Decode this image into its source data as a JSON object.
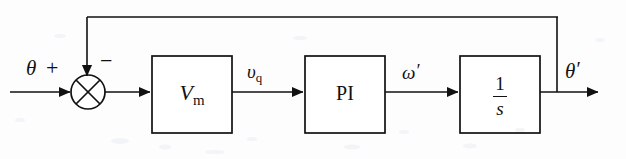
{
  "diagram": {
    "type": "control-system-block-diagram",
    "background_color": "#fdfdfe",
    "line_color": "#111111",
    "input": {
      "label": "θ",
      "name": "theta-reference-input"
    },
    "output": {
      "label": "θ",
      "prime": "′",
      "name": "theta-prime-output"
    },
    "summing_junction": {
      "name": "summing-junction",
      "style": "circle-with-cross",
      "plus_sign": "+",
      "minus_sign": "−"
    },
    "blocks": [
      {
        "id": "vm",
        "label": "V",
        "subscript": "m",
        "name": "vm-block",
        "x": 152,
        "y": 56,
        "w": 80,
        "h": 77
      },
      {
        "id": "pi",
        "label": "PI",
        "subscript": "",
        "name": "pi-controller-block",
        "x": 305,
        "y": 56,
        "w": 80,
        "h": 77
      },
      {
        "id": "integrator",
        "label": "1",
        "denominator": "s",
        "name": "integrator-block",
        "x": 460,
        "y": 56,
        "w": 80,
        "h": 77
      }
    ],
    "signals": [
      {
        "id": "vq",
        "label": "υ",
        "subscript": "q",
        "prime": "",
        "name": "vq-signal-label"
      },
      {
        "id": "omega",
        "label": "ω",
        "subscript": "",
        "prime": "′",
        "name": "omega-prime-signal-label"
      }
    ],
    "feedback": {
      "name": "feedback-path",
      "description": "output fed back to negative input of summing junction",
      "rail_y": 17,
      "tap_x": 557
    }
  }
}
